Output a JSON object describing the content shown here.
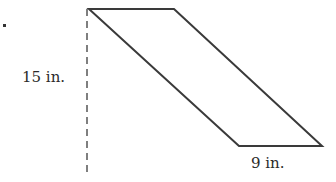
{
  "diagram": {
    "shape": "parallelogram",
    "labels": {
      "height": "15 in.",
      "base": "9 in."
    },
    "colors": {
      "stroke": "#3a3a3a",
      "dash": "#555555",
      "text": "#2a2a2a"
    }
  }
}
